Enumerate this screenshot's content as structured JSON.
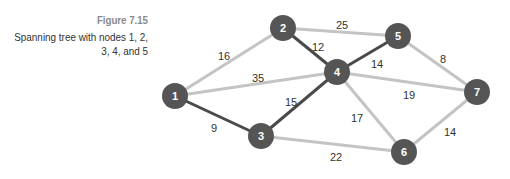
{
  "caption": {
    "figure_number": "Figure 7.15",
    "line1": "Spanning tree with nodes 1, 2,",
    "line2": "3, 4, and 5"
  },
  "colors": {
    "node": "#555555",
    "tree_edge": "#4a4a4a",
    "other_edge": "#c4c4c4",
    "node_text": "#ffffff"
  },
  "nodes": [
    {
      "id": "1",
      "x": 175,
      "y": 96
    },
    {
      "id": "2",
      "x": 283,
      "y": 28
    },
    {
      "id": "3",
      "x": 261,
      "y": 136
    },
    {
      "id": "4",
      "x": 337,
      "y": 72
    },
    {
      "id": "5",
      "x": 398,
      "y": 36
    },
    {
      "id": "6",
      "x": 404,
      "y": 152
    },
    {
      "id": "7",
      "x": 477,
      "y": 92
    }
  ],
  "edges": [
    {
      "from": "1",
      "to": "2",
      "weight": "16",
      "tree": false,
      "lx": 224,
      "ly": 57
    },
    {
      "from": "1",
      "to": "4",
      "weight": "35",
      "tree": false,
      "lx": 258,
      "ly": 79
    },
    {
      "from": "1",
      "to": "3",
      "weight": "9",
      "tree": true,
      "lx": 214,
      "ly": 129
    },
    {
      "from": "2",
      "to": "4",
      "weight": "12",
      "tree": true,
      "lx": 318,
      "ly": 48
    },
    {
      "from": "2",
      "to": "5",
      "weight": "25",
      "tree": false,
      "lx": 342,
      "ly": 26
    },
    {
      "from": "3",
      "to": "4",
      "weight": "15",
      "tree": true,
      "lx": 291,
      "ly": 103
    },
    {
      "from": "3",
      "to": "6",
      "weight": "22",
      "tree": false,
      "lx": 336,
      "ly": 158
    },
    {
      "from": "4",
      "to": "5",
      "weight": "14",
      "tree": true,
      "lx": 377,
      "ly": 65
    },
    {
      "from": "4",
      "to": "7",
      "weight": "19",
      "tree": false,
      "lx": 409,
      "ly": 96
    },
    {
      "from": "4",
      "to": "6",
      "weight": "17",
      "tree": false,
      "lx": 357,
      "ly": 119
    },
    {
      "from": "5",
      "to": "7",
      "weight": "8",
      "tree": false,
      "lx": 443,
      "ly": 60
    },
    {
      "from": "7",
      "to": "6",
      "weight": "14",
      "tree": false,
      "lx": 450,
      "ly": 133
    }
  ]
}
